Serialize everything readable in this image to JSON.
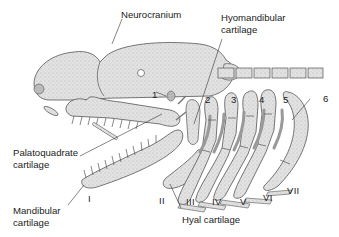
{
  "diagram": {
    "labels": {
      "neurocranium": "Neurocranium",
      "hyomandibular_line1": "Hyomandibular",
      "hyomandibular_line2": "cartilage",
      "palatoquadrate_line1": "Palatoquadrate",
      "palatoquadrate_line2": "cartilage",
      "mandibular_line1": "Mandibular",
      "mandibular_line2": "cartilage",
      "hyal": "Hyal cartilage"
    },
    "gill_slit_numbers": [
      "1",
      "2",
      "3",
      "4",
      "5",
      "6"
    ],
    "arch_numerals": [
      "I",
      "II",
      "III",
      "IV",
      "V",
      "VI",
      "VII"
    ],
    "colors": {
      "cartilage_fill": "#d9d9d9",
      "cartilage_dark": "#a8a8a8",
      "outline": "#555555",
      "text": "#222222",
      "background": "#ffffff"
    }
  }
}
